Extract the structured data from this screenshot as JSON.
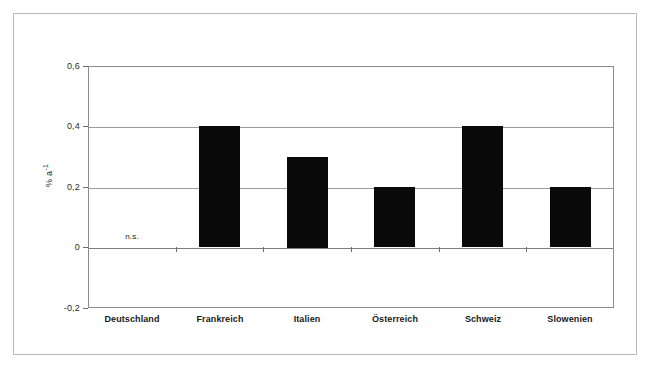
{
  "chart_data": {
    "type": "bar",
    "title": "",
    "subtitle": "",
    "xlabel": "",
    "ylabel": "% a-1",
    "ylabel_base": "% a",
    "ylabel_exponent": "-1",
    "categories": [
      "Deutschland",
      "Frankreich",
      "Italien",
      "Österreich",
      "Schweiz",
      "Slowenien"
    ],
    "values": [
      null,
      0.4,
      0.3,
      0.2,
      0.4,
      0.2
    ],
    "annotations": [
      {
        "category": "Deutschland",
        "text": "n.s."
      }
    ],
    "ylim": [
      -0.2,
      0.6
    ],
    "yticks": [
      0.6,
      0.4,
      0.2,
      0,
      -0.2
    ],
    "ytick_labels": [
      "0,6",
      "0,4",
      "0,2",
      "0",
      "-0,2"
    ],
    "grid": true,
    "grid_axis": "y",
    "legend": false,
    "legend_position": "none",
    "bar_color": "#0a0a0a",
    "grid_color": "#9a9a9a",
    "frame_color": "#8c8c8c",
    "outer_frame_color": "#b9b9b9",
    "background_color": "#ffffff"
  }
}
